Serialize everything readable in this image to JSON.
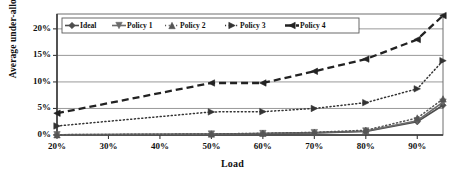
{
  "chart_data": {
    "type": "line",
    "title": "",
    "xlabel": "Load",
    "ylabel": "Average under-allocation",
    "xlim": [
      20,
      95
    ],
    "ylim": [
      0,
      22.8
    ],
    "grid": true,
    "legend_position": "top-left-inside",
    "xticks": [
      "20%",
      "30%",
      "40%",
      "50%",
      "60%",
      "70%",
      "80%",
      "90%"
    ],
    "xtick_values": [
      20,
      30,
      40,
      50,
      60,
      70,
      80,
      90
    ],
    "yticks": [
      "0%",
      "5%",
      "10%",
      "15%",
      "20%"
    ],
    "ytick_values": [
      0,
      5,
      10,
      15,
      20
    ],
    "x": [
      20,
      50,
      60,
      70,
      80,
      90,
      95
    ],
    "series": [
      {
        "name": "Ideal",
        "marker": "diamond",
        "line": "solid",
        "color": "#4d4d4d",
        "values": [
          0.05,
          0.15,
          0.25,
          0.4,
          0.65,
          2.5,
          5.6
        ]
      },
      {
        "name": "Policy 1",
        "marker": "triangle-down",
        "line": "solid",
        "color": "#6b6b6b",
        "values": [
          0.05,
          0.18,
          0.28,
          0.45,
          0.75,
          2.7,
          6.2
        ]
      },
      {
        "name": "Policy 2",
        "marker": "triangle-up",
        "line": "dotted",
        "color": "#555555",
        "values": [
          0.06,
          0.2,
          0.32,
          0.5,
          0.9,
          3.2,
          6.8
        ]
      },
      {
        "name": "Policy 3",
        "marker": "triangle-right",
        "line": "dotted",
        "color": "#333333",
        "values": [
          1.7,
          4.35,
          4.4,
          5.0,
          6.1,
          8.7,
          14.0
        ]
      },
      {
        "name": "Policy 4",
        "marker": "triangle-left",
        "line": "dashed",
        "color": "#222222",
        "values": [
          4.1,
          9.8,
          9.8,
          12.0,
          14.3,
          18.0,
          22.5
        ]
      }
    ]
  },
  "legend": {
    "items": [
      {
        "label": "Ideal"
      },
      {
        "label": "Policy 1"
      },
      {
        "label": "Policy 2"
      },
      {
        "label": "Policy 3"
      },
      {
        "label": "Policy 4"
      }
    ]
  }
}
